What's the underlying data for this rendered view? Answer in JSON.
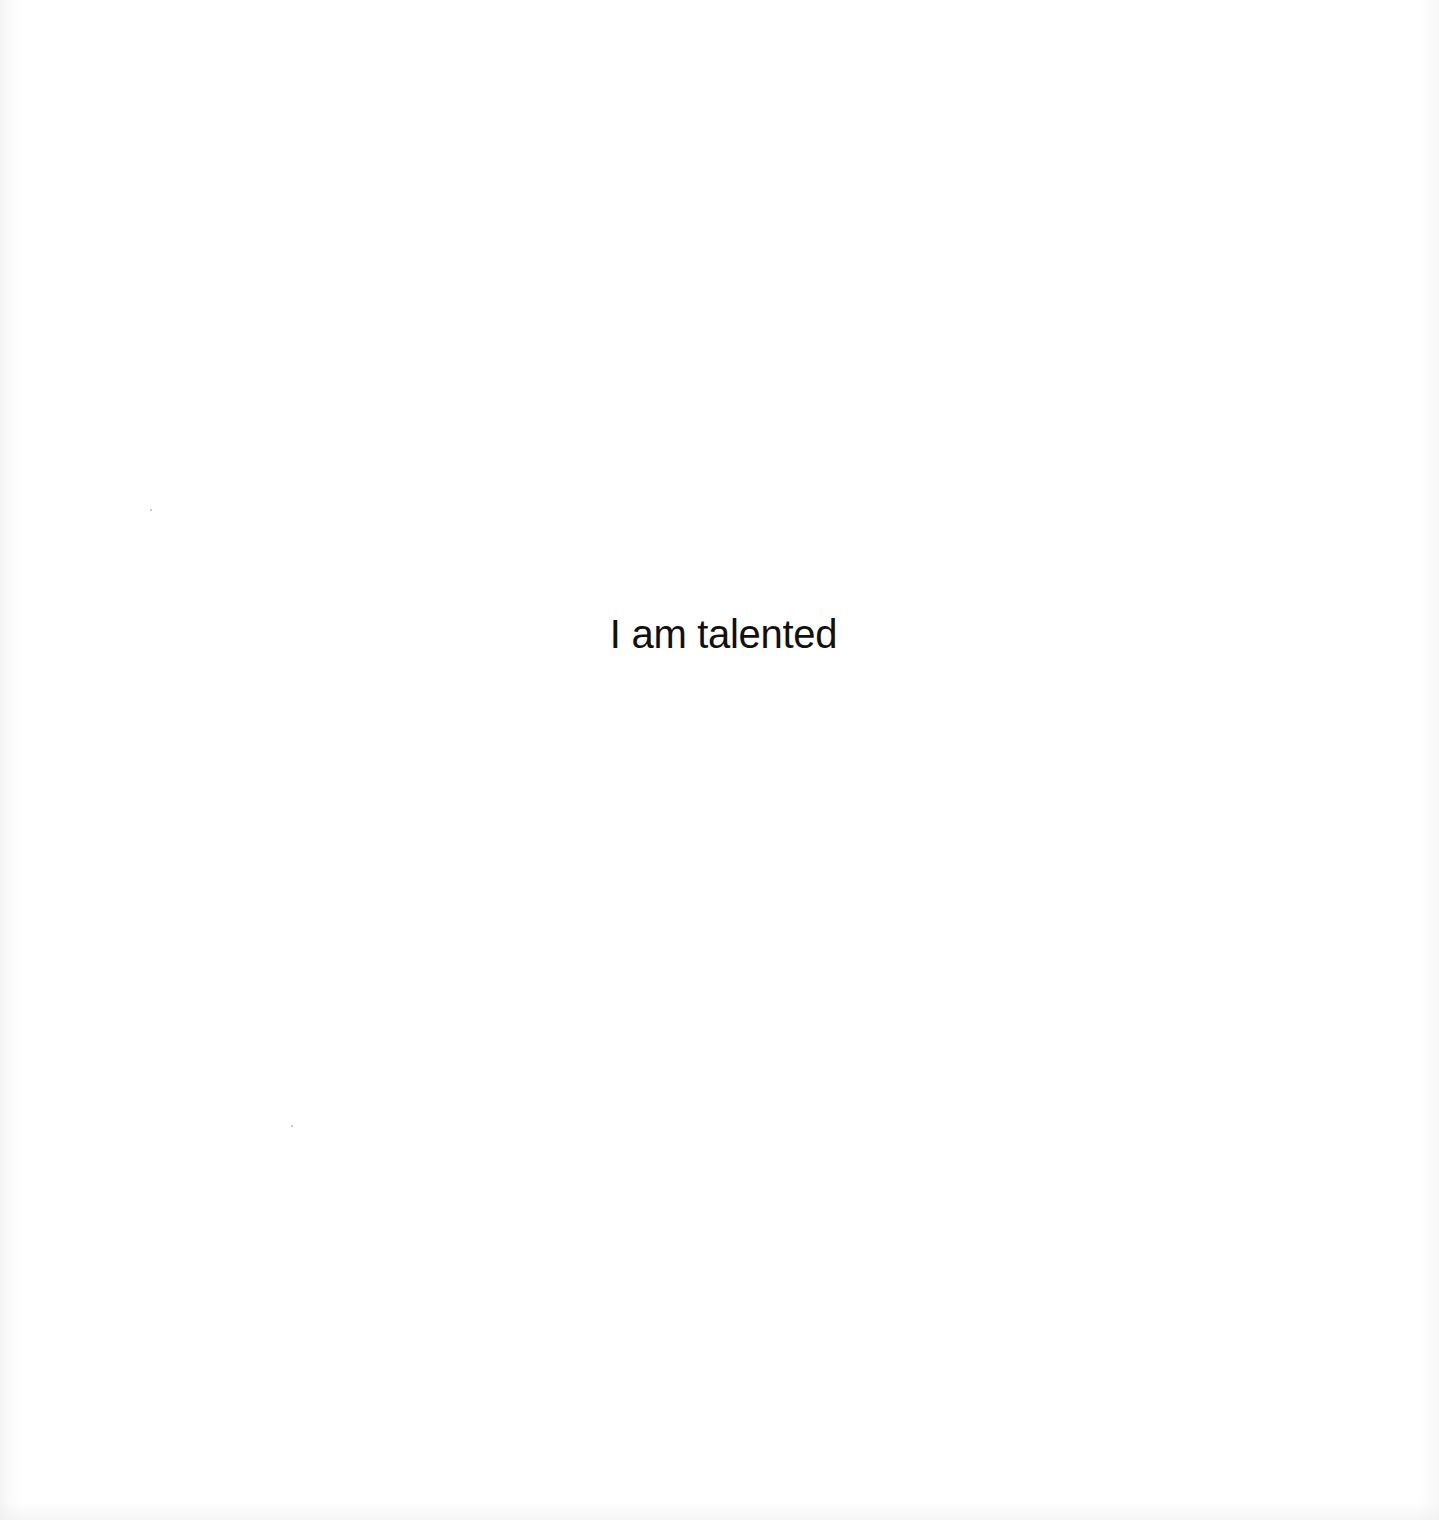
{
  "document": {
    "statement": "I am talented"
  }
}
